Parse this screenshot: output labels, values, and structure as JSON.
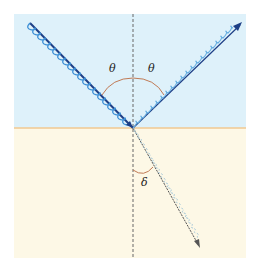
{
  "diagram": {
    "type": "wave reflection and refraction at an interface",
    "labels": {
      "theta_incident": "θ",
      "theta_reflected": "θ",
      "delta_refracted": "δ"
    },
    "colors": {
      "upper_medium": "#def1fa",
      "lower_medium": "#fdf8e6",
      "interface": "#f0c890",
      "incident_wave": "#3c8fd6",
      "incident_ray": "#1d3f86",
      "reflected_wave": "#66aee0",
      "reflected_ray": "#1d3f86",
      "refracted_wave": "#9ec4d8",
      "refracted_ray": "#555555",
      "angle_arc": "#c07a55",
      "normal_line": "#666666"
    }
  }
}
